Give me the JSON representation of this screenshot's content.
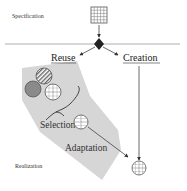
{
  "diagram": {
    "labels": {
      "specification": "Specification",
      "realization": "Realization",
      "reuse": "Reuse",
      "creation": "Creation",
      "selection": "Selection",
      "adaptation": "Adaptation"
    },
    "icons": {
      "specification_symbol": "grid-square-icon",
      "decision_symbol": "decision-diamond-icon",
      "component_striped": "striped-circle-icon",
      "component_solid": "solid-circle-icon",
      "component_grid": "grid-circle-icon",
      "selected_component": "grid-circle-icon",
      "result_component": "grid-circle-icon"
    },
    "colors": {
      "reuse_area": "#d4d4d4",
      "line": "#444444",
      "solid_circle": "#8a8a8a"
    }
  }
}
